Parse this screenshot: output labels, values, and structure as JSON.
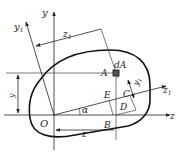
{
  "diagram": {
    "type": "cross-section-coordinate-rotation",
    "colors": {
      "line": "#222222",
      "outline": "#111111",
      "background": "#ffffff"
    },
    "labels": {
      "y": "y",
      "y1": "y",
      "y1_sub": "1",
      "z": "z",
      "z1": "z",
      "z1_sub": "1",
      "dim_z1": "z",
      "dim_z1_sub": "1",
      "dim_y": "y",
      "dim_y1": "y",
      "dim_y1_sub": "1",
      "dim_z": "z",
      "dA": "dA",
      "A": "A",
      "C": "C",
      "D": "D",
      "E": "E",
      "B": "B",
      "O": "O",
      "alpha": "α"
    }
  }
}
